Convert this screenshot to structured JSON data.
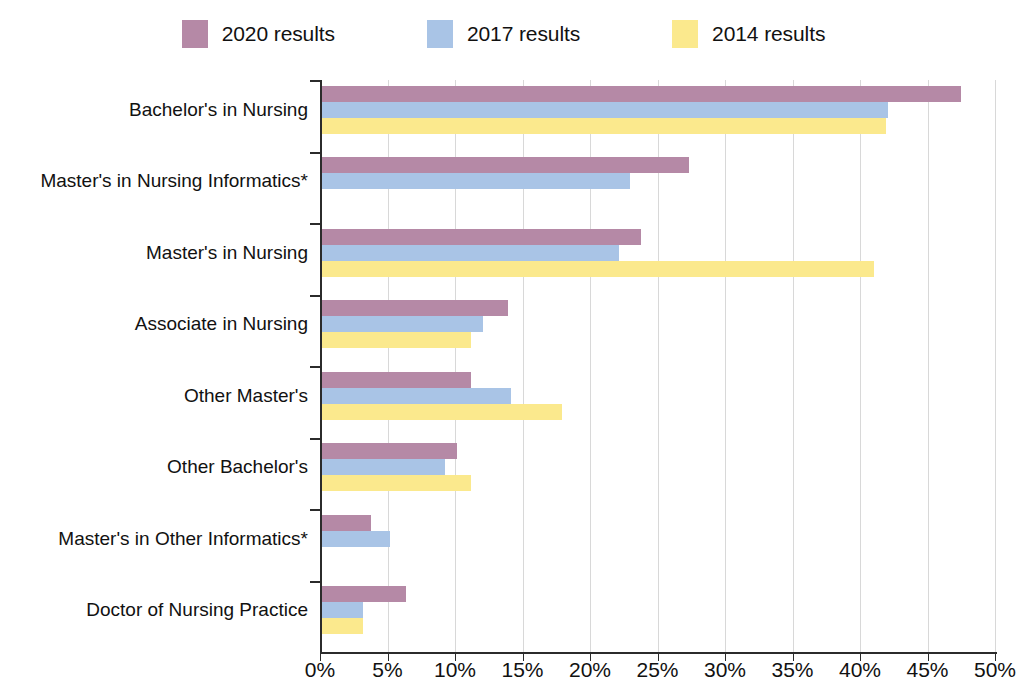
{
  "chart_data": {
    "type": "bar",
    "orientation": "horizontal",
    "title": "",
    "xlabel": "",
    "ylabel": "",
    "xlim": [
      0,
      50
    ],
    "xticks": [
      0,
      5,
      10,
      15,
      20,
      25,
      30,
      35,
      40,
      45,
      50
    ],
    "xtick_labels": [
      "0%",
      "5%",
      "10%",
      "15%",
      "20%",
      "25%",
      "30%",
      "35%",
      "40%",
      "45%",
      "50%"
    ],
    "grid": true,
    "legend_position": "top",
    "categories": [
      "Bachelor's in Nursing",
      "Master's in Nursing Informatics*",
      "Master's in Nursing",
      "Associate in Nursing",
      "Other Master's",
      "Other Bachelor's",
      "Master's in Other Informatics*",
      "Doctor of Nursing Practice"
    ],
    "series": [
      {
        "name": "2020 results",
        "color": "#b589a6",
        "values": [
          47.3,
          27.2,
          23.6,
          13.8,
          11.0,
          10.0,
          3.6,
          6.2
        ]
      },
      {
        "name": "2017 results",
        "color": "#a9c4e6",
        "values": [
          41.9,
          22.8,
          22.0,
          11.9,
          14.0,
          9.1,
          5.0,
          3.0
        ]
      },
      {
        "name": "2014 results",
        "color": "#fbe98d",
        "values": [
          41.8,
          null,
          40.9,
          11.0,
          17.8,
          11.0,
          null,
          3.0
        ]
      }
    ]
  },
  "legend": {
    "items": [
      {
        "label": "2020 results",
        "color": "#b589a6"
      },
      {
        "label": "2017 results",
        "color": "#a9c4e6"
      },
      {
        "label": "2014 results",
        "color": "#fbe98d"
      }
    ]
  },
  "axis": {
    "x_tick_labels": [
      "0%",
      "5%",
      "10%",
      "15%",
      "20%",
      "25%",
      "30%",
      "35%",
      "40%",
      "45%",
      "50%"
    ]
  },
  "colors": {
    "series_2020": "#b589a6",
    "series_2017": "#a9c4e6",
    "series_2014": "#fbe98d",
    "axis": "#2b2b2b",
    "grid": "#d8d8d8",
    "text": "#111111",
    "background": "#ffffff"
  }
}
